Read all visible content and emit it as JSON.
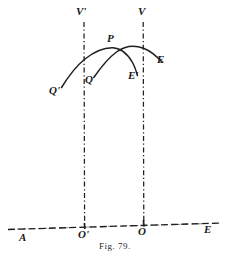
{
  "figure": {
    "caption": "Fig.  79.",
    "caption_prefix": "Fig.",
    "caption_number": "79.",
    "ink_color": "#1f1f1f",
    "background_color": "#ffffff",
    "width": 230,
    "height": 259
  },
  "labels": {
    "vertex_left": "V'",
    "vertex_right": "V",
    "apex": "P",
    "start_left": "Q'",
    "start_mid": "Q",
    "end_mid": "E'",
    "end_right": "E",
    "origin_left": "O'",
    "origin_right": "O",
    "axis_left": "A",
    "axis_right": "E"
  },
  "geometry": {
    "baseline": {
      "name": "horizontal-axis",
      "x1": 8,
      "y1": 229,
      "x2": 222,
      "y2": 223,
      "style": "dashed"
    },
    "vertical_left": {
      "name": "vertical-axis-left",
      "x": 84,
      "y_top": 22,
      "y_bottom": 228,
      "style": "dash-dot"
    },
    "vertical_right": {
      "name": "vertical-axis-right",
      "x": 143,
      "y_top": 22,
      "y_bottom": 226,
      "style": "dash-dot"
    },
    "arc_primary": {
      "name": "arc-Q-prime-to-E-prime",
      "from": "Q'",
      "through": "P",
      "to": "E'",
      "points": [
        [
          62,
          86
        ],
        [
          72,
          72
        ],
        [
          84,
          61
        ],
        [
          98,
          52
        ],
        [
          112,
          48
        ],
        [
          124,
          55
        ],
        [
          133,
          68
        ],
        [
          137,
          75
        ]
      ]
    },
    "arc_secondary": {
      "name": "arc-Q-to-E",
      "from": "Q",
      "through": "P",
      "to": "E",
      "points": [
        [
          94,
          77
        ],
        [
          105,
          63
        ],
        [
          115,
          53
        ],
        [
          128,
          47
        ],
        [
          141,
          48
        ],
        [
          152,
          54
        ],
        [
          162,
          62
        ]
      ]
    }
  },
  "label_positions": {
    "vertex_left": {
      "x": 78,
      "y": 8
    },
    "vertex_right": {
      "x": 139,
      "y": 8
    },
    "apex": {
      "x": 108,
      "y": 38
    },
    "start_left": {
      "x": 51,
      "y": 84
    },
    "start_mid": {
      "x": 86,
      "y": 75
    },
    "end_mid": {
      "x": 129,
      "y": 72
    },
    "end_right": {
      "x": 158,
      "y": 55
    },
    "origin_left": {
      "x": 79,
      "y": 230
    },
    "origin_right": {
      "x": 138,
      "y": 228
    },
    "axis_left": {
      "x": 20,
      "y": 234
    },
    "axis_right": {
      "x": 205,
      "y": 226
    },
    "caption": {
      "y": 240
    }
  }
}
